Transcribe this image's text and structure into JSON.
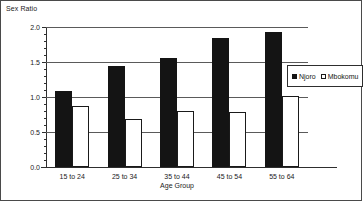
{
  "chart_data": {
    "type": "bar",
    "title": "",
    "ylabel": "Sex Ratio",
    "xlabel": "Age Group",
    "categories": [
      "15 to 24",
      "25 to 34",
      "35 to 44",
      "45 to 54",
      "55 to 64"
    ],
    "series": [
      {
        "name": "Njoro",
        "values": [
          1.08,
          1.44,
          1.56,
          1.85,
          1.93
        ],
        "color": "#141414",
        "style": "filled"
      },
      {
        "name": "Mbokomu",
        "values": [
          0.87,
          0.69,
          0.8,
          0.79,
          1.02
        ],
        "color": "#ffffff",
        "style": "hollow"
      }
    ],
    "ylim": [
      0.0,
      2.0
    ],
    "ytick_labels": [
      "0.0",
      "0.5",
      "1.0",
      "1.5",
      "2.0"
    ],
    "ytick_values": [
      0.0,
      0.5,
      1.0,
      1.5,
      2.0
    ],
    "yminor_step": 0.1,
    "grid": "horizontal",
    "legend_position": "right-inside"
  }
}
